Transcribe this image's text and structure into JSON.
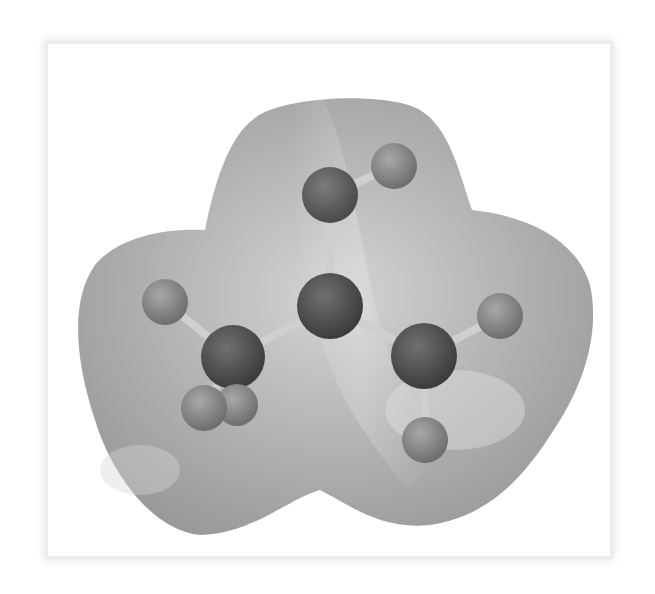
{
  "figure": {
    "colors": {
      "background": "#ffffff",
      "frame_shadow": "#e4e4e4",
      "surface_base": "#a8a8a8",
      "surface_highlight": "#d6d6d6",
      "heavy_atom": "#4a4a4a",
      "mid_atom": "#5c5c5c",
      "light_atom": "#8a8a8a",
      "bond": "#c8c8c8"
    },
    "atoms": [
      {
        "id": "center",
        "cx": 330,
        "cy": 306,
        "r": 33,
        "shade": "heavy"
      },
      {
        "id": "top",
        "cx": 330,
        "cy": 195,
        "r": 28,
        "shade": "mid"
      },
      {
        "id": "top-right-h",
        "cx": 394,
        "cy": 166,
        "r": 23,
        "shade": "light"
      },
      {
        "id": "left",
        "cx": 233,
        "cy": 357,
        "r": 32,
        "shade": "heavy"
      },
      {
        "id": "left-h-upper",
        "cx": 165,
        "cy": 302,
        "r": 23,
        "shade": "light"
      },
      {
        "id": "left-h-lower-a",
        "cx": 204,
        "cy": 408,
        "r": 23,
        "shade": "light"
      },
      {
        "id": "left-h-lower-b",
        "cx": 237,
        "cy": 405,
        "r": 21,
        "shade": "light"
      },
      {
        "id": "right",
        "cx": 424,
        "cy": 356,
        "r": 33,
        "shade": "heavy"
      },
      {
        "id": "right-h-upper",
        "cx": 500,
        "cy": 316,
        "r": 23,
        "shade": "light"
      },
      {
        "id": "right-h-lower",
        "cx": 425,
        "cy": 440,
        "r": 23,
        "shade": "light"
      }
    ],
    "bonds": [
      [
        "center",
        "top"
      ],
      [
        "top",
        "top-right-h"
      ],
      [
        "center",
        "left"
      ],
      [
        "center",
        "right"
      ],
      [
        "left",
        "left-h-upper"
      ],
      [
        "left",
        "left-h-lower-a"
      ],
      [
        "left",
        "left-h-lower-b"
      ],
      [
        "right",
        "right-h-upper"
      ],
      [
        "right",
        "right-h-lower"
      ]
    ]
  }
}
